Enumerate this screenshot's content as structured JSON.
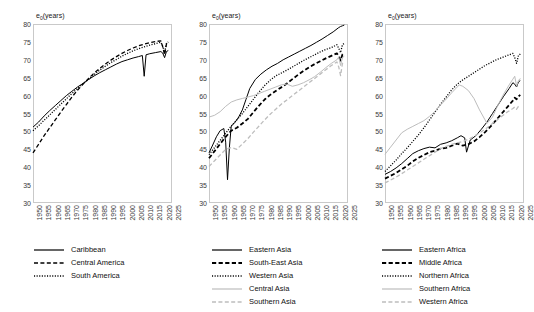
{
  "chart_data": [
    {
      "type": "line",
      "title": "",
      "panel_name": "latin-america-caribbean",
      "ylabel": "e₀(years)",
      "xlabel": "",
      "ylim": [
        30,
        80
      ],
      "ytick_labels": [
        "30",
        "35",
        "40",
        "45",
        "50",
        "55",
        "60",
        "65",
        "70",
        "75",
        "80"
      ],
      "xlim": [
        1950,
        2025
      ],
      "xtick_labels": [
        "1950",
        "1955",
        "1960",
        "1965",
        "1970",
        "1975",
        "1980",
        "1985",
        "1990",
        "1995",
        "2000",
        "2005",
        "2010",
        "2015",
        "2020",
        "2025"
      ],
      "grid": false,
      "legend_position": "below",
      "series": [
        {
          "name": "Caribbean",
          "style": "solid",
          "color": "#000000",
          "x": [
            1950,
            1953,
            1956,
            1959,
            1962,
            1965,
            1968,
            1971,
            1974,
            1977,
            1980,
            1983,
            1986,
            1989,
            1992,
            1995,
            1998,
            2001,
            2004,
            2007,
            2009,
            2010,
            2011,
            2013,
            2016,
            2019,
            2020,
            2021,
            2022,
            2023
          ],
          "values": [
            51.2,
            52.6,
            54.3,
            55.8,
            57.2,
            58.6,
            60.0,
            61.2,
            62.4,
            63.4,
            64.5,
            65.5,
            66.4,
            67.2,
            68.0,
            68.8,
            69.5,
            70.0,
            70.5,
            70.9,
            71.2,
            65.4,
            71.4,
            71.7,
            72.0,
            72.3,
            71.9,
            70.6,
            72.3,
            72.6
          ]
        },
        {
          "name": "Central America",
          "style": "dashed",
          "color": "#000000",
          "x": [
            1950,
            1953,
            1956,
            1959,
            1962,
            1965,
            1968,
            1971,
            1974,
            1977,
            1980,
            1983,
            1986,
            1989,
            1992,
            1995,
            1998,
            2001,
            2004,
            2007,
            2010,
            2013,
            2016,
            2019,
            2020,
            2021,
            2022,
            2023
          ],
          "values": [
            44.0,
            46.4,
            48.8,
            51.0,
            53.2,
            55.4,
            57.5,
            59.6,
            61.5,
            63.2,
            64.8,
            66.3,
            67.6,
            68.8,
            69.9,
            70.9,
            71.8,
            72.6,
            73.3,
            73.9,
            74.4,
            74.8,
            75.1,
            75.3,
            73.6,
            71.4,
            74.4,
            75.0
          ]
        },
        {
          "name": "South America",
          "style": "dotted",
          "color": "#000000",
          "x": [
            1950,
            1953,
            1956,
            1959,
            1962,
            1965,
            1968,
            1971,
            1974,
            1977,
            1980,
            1983,
            1986,
            1989,
            1992,
            1995,
            1998,
            2001,
            2004,
            2007,
            2010,
            2013,
            2016,
            2019,
            2020,
            2021,
            2022,
            2023
          ],
          "values": [
            50.2,
            51.6,
            53.1,
            54.6,
            56.1,
            57.6,
            59.1,
            60.6,
            62.0,
            63.3,
            64.6,
            65.9,
            67.1,
            68.2,
            69.2,
            70.1,
            71.0,
            71.8,
            72.5,
            73.1,
            73.6,
            74.1,
            74.5,
            74.9,
            73.8,
            72.1,
            74.6,
            75.0
          ]
        }
      ]
    },
    {
      "type": "line",
      "title": "",
      "panel_name": "asia",
      "ylabel": "e₀(years)",
      "xlabel": "",
      "ylim": [
        30,
        80
      ],
      "ytick_labels": [
        "30",
        "35",
        "40",
        "45",
        "50",
        "55",
        "60",
        "65",
        "70",
        "75",
        "80"
      ],
      "xlim": [
        1950,
        2025
      ],
      "xtick_labels": [
        "1950",
        "1955",
        "1960",
        "1965",
        "1970",
        "1975",
        "1980",
        "1985",
        "1990",
        "1995",
        "2000",
        "2005",
        "2010",
        "2015",
        "2020",
        "2025"
      ],
      "grid": false,
      "legend_position": "below",
      "series": [
        {
          "name": "Eastern Asia",
          "style": "solid",
          "color": "#000000",
          "x": [
            1950,
            1952,
            1954,
            1956,
            1958,
            1959,
            1960,
            1961,
            1962,
            1964,
            1966,
            1968,
            1970,
            1972,
            1975,
            1978,
            1981,
            1984,
            1987,
            1990,
            1993,
            1996,
            1999,
            2002,
            2005,
            2008,
            2011,
            2014,
            2017,
            2020,
            2021,
            2022,
            2023
          ],
          "values": [
            44.0,
            46.2,
            48.5,
            50.2,
            50.8,
            47.0,
            36.5,
            45.5,
            51.5,
            52.5,
            54.0,
            56.0,
            59.0,
            62.0,
            64.5,
            66.0,
            67.2,
            68.2,
            69.0,
            70.0,
            70.8,
            71.6,
            72.4,
            73.2,
            74.0,
            74.9,
            75.8,
            76.8,
            77.8,
            79.0,
            79.3,
            79.5,
            79.7
          ]
        },
        {
          "name": "South-East Asia",
          "style": "dashed-bold",
          "color": "#000000",
          "x": [
            1950,
            1953,
            1956,
            1959,
            1962,
            1965,
            1968,
            1971,
            1974,
            1977,
            1980,
            1983,
            1986,
            1989,
            1992,
            1995,
            1998,
            2001,
            2004,
            2007,
            2010,
            2013,
            2016,
            2019,
            2020,
            2021,
            2022,
            2023
          ],
          "values": [
            42.5,
            44.5,
            46.5,
            48.5,
            50.2,
            51.0,
            52.2,
            53.5,
            55.4,
            57.2,
            58.9,
            60.2,
            61.3,
            62.3,
            63.4,
            64.6,
            65.8,
            66.9,
            67.9,
            68.8,
            69.6,
            70.4,
            71.1,
            71.8,
            71.0,
            69.8,
            71.5,
            72.0
          ]
        },
        {
          "name": "Western Asia",
          "style": "dotted",
          "color": "#000000",
          "x": [
            1950,
            1953,
            1956,
            1959,
            1962,
            1965,
            1968,
            1971,
            1974,
            1977,
            1980,
            1983,
            1986,
            1989,
            1992,
            1995,
            1998,
            2001,
            2004,
            2007,
            2010,
            2013,
            2016,
            2019,
            2020,
            2021,
            2022,
            2023
          ],
          "values": [
            43.5,
            45.5,
            47.5,
            49.5,
            51.5,
            53.2,
            55.0,
            57.0,
            59.0,
            61.0,
            62.8,
            64.3,
            65.5,
            66.3,
            67.1,
            68.0,
            68.9,
            69.8,
            70.6,
            71.4,
            72.2,
            72.9,
            73.4,
            74.2,
            73.2,
            72.0,
            74.2,
            74.6
          ]
        },
        {
          "name": "Central Asia",
          "style": "solid-light",
          "color": "#bdbdbd",
          "x": [
            1950,
            1953,
            1956,
            1959,
            1962,
            1965,
            1968,
            1971,
            1974,
            1977,
            1980,
            1983,
            1986,
            1989,
            1992,
            1995,
            1998,
            2001,
            2004,
            2007,
            2010,
            2013,
            2016,
            2019,
            2020,
            2021,
            2022,
            2023
          ],
          "values": [
            54.0,
            54.5,
            55.5,
            57.0,
            58.2,
            58.8,
            59.2,
            59.6,
            60.0,
            60.6,
            61.2,
            61.8,
            62.4,
            63.0,
            63.2,
            62.6,
            63.0,
            63.6,
            64.4,
            65.3,
            66.5,
            67.8,
            69.0,
            70.0,
            70.8,
            68.4,
            70.6,
            71.0
          ]
        },
        {
          "name": "Southern Asia",
          "style": "dashed-light",
          "color": "#bdbdbd",
          "x": [
            1950,
            1953,
            1956,
            1959,
            1962,
            1965,
            1968,
            1971,
            1974,
            1977,
            1980,
            1983,
            1986,
            1989,
            1992,
            1995,
            1998,
            2001,
            2004,
            2007,
            2010,
            2013,
            2016,
            2019,
            2020,
            2021,
            2022,
            2023
          ],
          "values": [
            40.2,
            41.8,
            43.4,
            45.0,
            45.5,
            45.0,
            46.5,
            48.0,
            49.8,
            51.5,
            53.2,
            54.8,
            56.2,
            57.6,
            58.8,
            60.0,
            61.2,
            62.4,
            63.6,
            64.8,
            66.0,
            67.2,
            68.4,
            69.4,
            68.0,
            65.6,
            69.0,
            69.6
          ]
        }
      ]
    },
    {
      "type": "line",
      "title": "",
      "panel_name": "africa",
      "ylabel": "e₀(years)",
      "xlabel": "",
      "ylim": [
        30,
        80
      ],
      "ytick_labels": [
        "30",
        "35",
        "40",
        "45",
        "50",
        "55",
        "60",
        "65",
        "70",
        "75",
        "80"
      ],
      "xlim": [
        1950,
        2025
      ],
      "xtick_labels": [
        "1950",
        "1955",
        "1960",
        "1965",
        "1970",
        "1975",
        "1980",
        "1985",
        "1990",
        "1995",
        "2000",
        "2005",
        "2010",
        "2015",
        "2020",
        "2025"
      ],
      "grid": false,
      "legend_position": "below",
      "series": [
        {
          "name": "Eastern Africa",
          "style": "solid",
          "color": "#000000",
          "x": [
            1950,
            1953,
            1956,
            1959,
            1962,
            1965,
            1968,
            1971,
            1974,
            1977,
            1980,
            1983,
            1986,
            1989,
            1991,
            1993,
            1994,
            1996,
            1999,
            2002,
            2005,
            2008,
            2011,
            2014,
            2017,
            2019,
            2020,
            2021,
            2022,
            2023
          ],
          "values": [
            38.0,
            38.8,
            39.8,
            41.0,
            42.4,
            43.8,
            44.6,
            45.2,
            45.6,
            45.4,
            46.4,
            46.8,
            47.4,
            48.2,
            48.8,
            48.2,
            44.2,
            47.6,
            48.8,
            50.6,
            52.6,
            55.0,
            57.4,
            59.8,
            62.0,
            63.6,
            63.2,
            62.4,
            63.8,
            64.2
          ]
        },
        {
          "name": "Middle Africa",
          "style": "dashed-bold",
          "color": "#000000",
          "x": [
            1950,
            1953,
            1956,
            1959,
            1962,
            1965,
            1968,
            1971,
            1974,
            1977,
            1980,
            1983,
            1986,
            1989,
            1992,
            1995,
            1998,
            2001,
            2004,
            2007,
            2010,
            2013,
            2016,
            2019,
            2020,
            2021,
            2022,
            2023
          ],
          "values": [
            36.8,
            37.6,
            38.4,
            39.4,
            40.4,
            41.6,
            42.6,
            43.4,
            44.2,
            44.6,
            45.2,
            45.4,
            46.0,
            46.6,
            46.0,
            46.4,
            47.2,
            48.4,
            49.8,
            51.4,
            53.2,
            55.0,
            56.8,
            58.6,
            59.4,
            59.0,
            59.8,
            60.2
          ]
        },
        {
          "name": "Northern Africa",
          "style": "dotted",
          "color": "#000000",
          "x": [
            1950,
            1953,
            1956,
            1959,
            1962,
            1965,
            1968,
            1971,
            1974,
            1977,
            1980,
            1983,
            1986,
            1989,
            1992,
            1995,
            1998,
            2001,
            2004,
            2007,
            2010,
            2013,
            2016,
            2019,
            2020,
            2021,
            2022,
            2023
          ],
          "values": [
            38.8,
            40.4,
            42.0,
            43.8,
            45.4,
            47.2,
            49.0,
            51.0,
            53.2,
            55.4,
            57.6,
            59.6,
            61.6,
            63.2,
            64.4,
            65.4,
            66.4,
            67.4,
            68.4,
            69.2,
            70.0,
            70.6,
            71.2,
            71.8,
            70.6,
            69.0,
            71.2,
            71.6
          ]
        },
        {
          "name": "Southern Africa",
          "style": "solid-light",
          "color": "#bdbdbd",
          "x": [
            1950,
            1953,
            1956,
            1959,
            1962,
            1965,
            1968,
            1971,
            1974,
            1977,
            1980,
            1983,
            1986,
            1989,
            1990,
            1992,
            1995,
            1998,
            2001,
            2004,
            2005,
            2008,
            2011,
            2014,
            2017,
            2019,
            2020,
            2021,
            2022,
            2023
          ],
          "values": [
            43.6,
            45.6,
            47.6,
            49.6,
            50.6,
            51.4,
            52.2,
            53.0,
            54.2,
            55.6,
            57.4,
            59.0,
            60.8,
            62.4,
            63.0,
            62.6,
            61.4,
            59.2,
            56.0,
            53.2,
            52.2,
            54.0,
            57.4,
            60.4,
            63.0,
            64.6,
            65.4,
            62.6,
            64.2,
            64.8
          ]
        },
        {
          "name": "Western Africa",
          "style": "dashed-light",
          "color": "#bdbdbd",
          "x": [
            1950,
            1953,
            1956,
            1959,
            1962,
            1965,
            1968,
            1971,
            1974,
            1977,
            1980,
            1983,
            1986,
            1989,
            1992,
            1995,
            1998,
            2001,
            2004,
            2007,
            2010,
            2013,
            2016,
            2019,
            2020,
            2021,
            2022,
            2023
          ],
          "values": [
            35.6,
            36.4,
            37.2,
            38.2,
            39.2,
            40.2,
            41.2,
            42.2,
            43.2,
            44.2,
            45.2,
            45.8,
            46.4,
            46.8,
            47.2,
            47.8,
            48.6,
            49.6,
            50.6,
            51.8,
            53.0,
            54.2,
            55.4,
            56.4,
            56.8,
            56.2,
            57.0,
            57.4
          ]
        }
      ]
    }
  ],
  "panels": [
    {
      "ylabel": "e₀(years)",
      "legend": [
        {
          "label": "Caribbean",
          "style": "solid"
        },
        {
          "label": "Central America",
          "style": "dashed"
        },
        {
          "label": "South America",
          "style": "dotted"
        }
      ]
    },
    {
      "ylabel": "e₀(years)",
      "legend": [
        {
          "label": "Eastern Asia",
          "style": "solid"
        },
        {
          "label": "South-East Asia",
          "style": "dashed-bold"
        },
        {
          "label": "Western Asia",
          "style": "dotted"
        },
        {
          "label": "Central Asia",
          "style": "solid-light"
        },
        {
          "label": "Southern Asia",
          "style": "dashed-light"
        }
      ]
    },
    {
      "ylabel": "e₀(years)",
      "legend": [
        {
          "label": "Eastern Africa",
          "style": "solid"
        },
        {
          "label": "Middle Africa",
          "style": "dashed-bold"
        },
        {
          "label": "Northern Africa",
          "style": "dotted"
        },
        {
          "label": "Southern Africa",
          "style": "solid-light"
        },
        {
          "label": "Western Africa",
          "style": "dashed-light"
        }
      ]
    }
  ],
  "colors": {
    "line_dark": "#000000",
    "line_light": "#bdbdbd",
    "frame": "#c9c9c9",
    "text": "#1a1a1a",
    "background": "#ffffff"
  }
}
